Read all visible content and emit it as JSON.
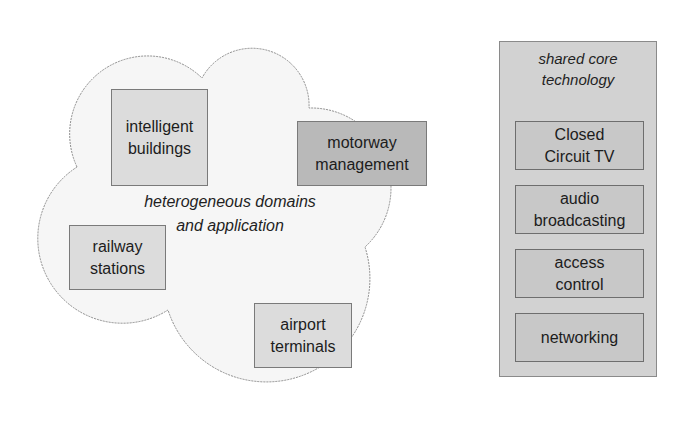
{
  "diagram": {
    "cloud": {
      "label_lines": [
        "heterogeneous domains",
        "and application"
      ],
      "fill": "#f6f6f6",
      "stroke": "#8c8c8c",
      "domains": [
        {
          "id": "intelligent-buildings",
          "lines": [
            "intelligent",
            "buildings"
          ],
          "shade": "light"
        },
        {
          "id": "motorway-management",
          "lines": [
            "motorway",
            "management"
          ],
          "shade": "dark"
        },
        {
          "id": "railway-stations",
          "lines": [
            "railway",
            "stations"
          ],
          "shade": "light"
        },
        {
          "id": "airport-terminals",
          "lines": [
            "airport",
            "terminals"
          ],
          "shade": "light"
        }
      ]
    },
    "core": {
      "title_lines": [
        "shared core",
        "technology"
      ],
      "items": [
        {
          "id": "cctv",
          "lines": [
            "Closed",
            "Circuit TV"
          ]
        },
        {
          "id": "audio-broadcasting",
          "lines": [
            "audio",
            "broadcasting"
          ]
        },
        {
          "id": "access-control",
          "lines": [
            "access",
            "control"
          ]
        },
        {
          "id": "networking",
          "lines": [
            "networking"
          ]
        }
      ]
    },
    "colors": {
      "light_box": "#dcdcdc",
      "dark_box": "#b9b9b9",
      "core_panel": "#d2d2d2",
      "core_item": "#c8c8c8"
    }
  }
}
